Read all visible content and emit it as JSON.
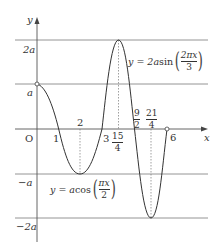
{
  "axes": {
    "x_label": "x",
    "y_label": "y",
    "origin_label": "O"
  },
  "y_ticks": {
    "two_a": "2a",
    "a": "a",
    "neg_a": "−a",
    "neg_two_a": "−2a"
  },
  "x_ticks": {
    "one": "1",
    "two": "2",
    "three": "3",
    "fifteen_fourths": {
      "num": "15",
      "den": "4"
    },
    "nine_halves": {
      "num": "9",
      "den": "2"
    },
    "twentyone_fourths": {
      "num": "21",
      "den": "4"
    },
    "six": "6"
  },
  "curves": {
    "sin_curve": {
      "prefix": "y = 2a",
      "func": "sin",
      "frac_num": "2πx",
      "frac_den": "3"
    },
    "cos_curve": {
      "prefix": "y = a",
      "func": "cos",
      "frac_num": "πx",
      "frac_den": "2"
    }
  },
  "colors": {
    "curve": "#333333",
    "axis": "#555555",
    "gridline": "#888888",
    "dotted": "#777777"
  }
}
